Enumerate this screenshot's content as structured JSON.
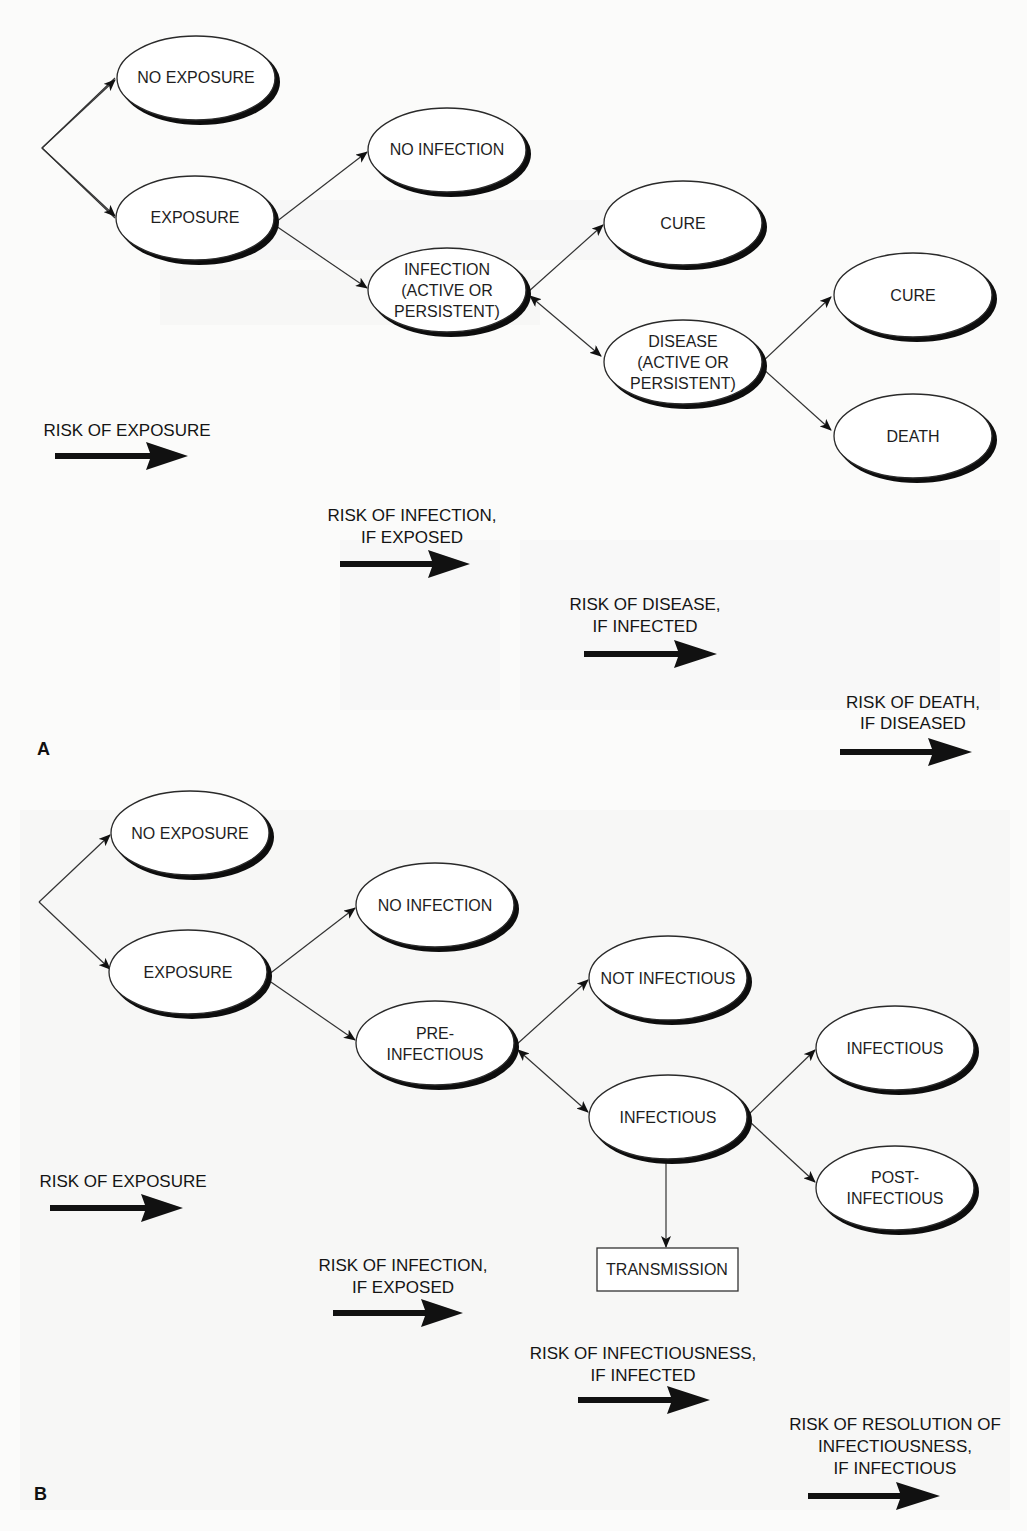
{
  "figure": {
    "panel_a": {
      "letter": "A",
      "nodes": {
        "no_exposure": [
          "NO EXPOSURE"
        ],
        "exposure": [
          "EXPOSURE"
        ],
        "no_infection": [
          "NO INFECTION"
        ],
        "infection": [
          "INFECTION",
          "(ACTIVE OR",
          "PERSISTENT)"
        ],
        "cure_1": [
          "CURE"
        ],
        "disease": [
          "DISEASE",
          "(ACTIVE OR",
          "PERSISTENT)"
        ],
        "cure_2": [
          "CURE"
        ],
        "death": [
          "DEATH"
        ]
      },
      "risks": [
        [
          "RISK OF EXPOSURE"
        ],
        [
          "RISK OF INFECTION,",
          "IF EXPOSED"
        ],
        [
          "RISK OF DISEASE,",
          "IF INFECTED"
        ],
        [
          "RISK OF DEATH,",
          "IF DISEASED"
        ]
      ]
    },
    "panel_b": {
      "letter": "B",
      "nodes": {
        "no_exposure": [
          "NO EXPOSURE"
        ],
        "exposure": [
          "EXPOSURE"
        ],
        "no_infection": [
          "NO INFECTION"
        ],
        "pre_infectious": [
          "PRE-",
          "INFECTIOUS"
        ],
        "not_infectious": [
          "NOT INFECTIOUS"
        ],
        "infectious_mid": [
          "INFECTIOUS"
        ],
        "infectious_right": [
          "INFECTIOUS"
        ],
        "post_infectious": [
          "POST-",
          "INFECTIOUS"
        ],
        "transmission": [
          "TRANSMISSION"
        ]
      },
      "risks": [
        [
          "RISK OF EXPOSURE"
        ],
        [
          "RISK OF INFECTION,",
          "IF EXPOSED"
        ],
        [
          "RISK OF INFECTIOUSNESS,",
          "IF INFECTED"
        ],
        [
          "RISK OF RESOLUTION OF",
          "INFECTIOUSNESS,",
          "IF INFECTIOUS"
        ]
      ]
    }
  }
}
